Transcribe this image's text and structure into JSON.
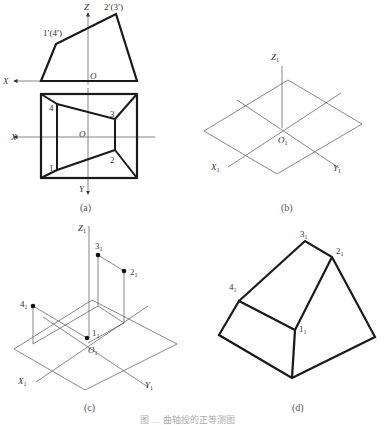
{
  "figure": {
    "caption": "图 … 曲轴投的正等测图",
    "panels": [
      {
        "id": "a",
        "caption": "(a)",
        "type": "orthographic-views"
      },
      {
        "id": "b",
        "caption": "(b)",
        "type": "isometric-axes"
      },
      {
        "id": "c",
        "caption": "(c)",
        "type": "isometric-point-construction"
      },
      {
        "id": "d",
        "caption": "(d)",
        "type": "isometric-solid"
      }
    ]
  },
  "panel_a": {
    "caption": "(a)",
    "axis_z": "Z",
    "axis_x_front": "X",
    "axis_x_top": "X",
    "axis_y": "Y",
    "origin_front": "O",
    "origin_top": "O",
    "front_labels": {
      "p14": "1′(4′)",
      "p23": "2′(3′)"
    },
    "top_labels": {
      "p1": "1",
      "p2": "2",
      "p3": "3",
      "p4": "4"
    }
  },
  "panel_b": {
    "caption": "(b)",
    "axis_z": "Z",
    "axis_x": "X",
    "axis_y": "Y",
    "origin": "O",
    "subscript": "1"
  },
  "panel_c": {
    "caption": "(c)",
    "axis_z": "Z",
    "axis_x": "X",
    "axis_y": "Y",
    "origin": "O",
    "subscript": "1",
    "points": {
      "p1": "1",
      "p2": "2",
      "p3": "3",
      "p4": "4"
    }
  },
  "panel_d": {
    "caption": "(d)",
    "subscript": "1",
    "points": {
      "p1": "1",
      "p2": "2",
      "p3": "3",
      "p4": "4"
    }
  },
  "colors": {
    "thick_line": "#1a1a1a",
    "thin_line": "#555555",
    "text": "#333333"
  }
}
